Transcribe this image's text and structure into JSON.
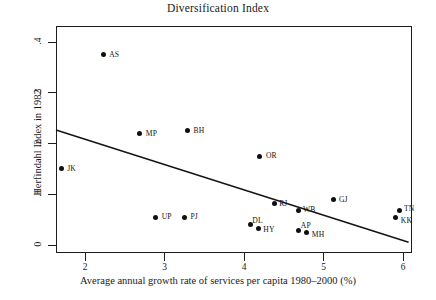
{
  "chart_data": {
    "type": "scatter",
    "title": "Diversification Index",
    "xlabel": "Average annual growth rate of services per capita 1980–2000 (%)",
    "ylabel": "Herfindahl Index in 1982",
    "xlim": [
      1.6,
      6.1
    ],
    "ylim": [
      -0.005,
      0.43
    ],
    "xticks": [
      "2",
      "3",
      "4",
      "5",
      "6"
    ],
    "xtick_values": [
      2,
      3,
      4,
      5,
      6
    ],
    "yticks": [
      ".4",
      ".3",
      ".2",
      ".1",
      "0"
    ],
    "ytick_values": [
      0.4,
      0.3,
      0.2,
      0.1,
      0
    ],
    "grid": false,
    "legend": "none",
    "points": [
      {
        "label": "AS",
        "x": 2.23,
        "y": 0.375
      },
      {
        "label": "MP",
        "x": 2.69,
        "y": 0.219
      },
      {
        "label": "BH",
        "x": 3.29,
        "y": 0.225
      },
      {
        "label": "JK",
        "x": 1.7,
        "y": 0.15
      },
      {
        "label": "OR",
        "x": 4.2,
        "y": 0.175
      },
      {
        "label": "GJ",
        "x": 5.12,
        "y": 0.089
      },
      {
        "label": "RJ",
        "x": 4.38,
        "y": 0.081
      },
      {
        "label": "TN",
        "x": 5.95,
        "y": 0.067
      },
      {
        "label": "KK",
        "x": 5.91,
        "y": 0.055
      },
      {
        "label": "WB",
        "x": 4.68,
        "y": 0.067
      },
      {
        "label": "UP",
        "x": 2.89,
        "y": 0.055
      },
      {
        "label": "PJ",
        "x": 3.25,
        "y": 0.055
      },
      {
        "label": "DL",
        "x": 4.08,
        "y": 0.04
      },
      {
        "label": "HY",
        "x": 4.18,
        "y": 0.033
      },
      {
        "label": "AP",
        "x": 4.69,
        "y": 0.029
      },
      {
        "label": "MH",
        "x": 4.79,
        "y": 0.024
      }
    ],
    "fit_line": {
      "type": "linear",
      "x_start": 1.635,
      "y_start": 0.2265,
      "x_end": 6.07,
      "y_end": 0.0055
    }
  }
}
